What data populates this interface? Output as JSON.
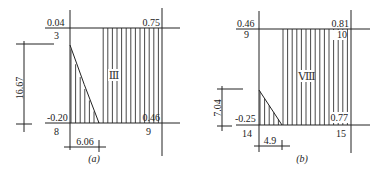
{
  "panels": [
    {
      "id": "a",
      "caption": "(a)",
      "region_label": "Ⅲ",
      "top_left_value": "0.04",
      "top_right_value": "0.75",
      "bottom_left_value": "-0.20",
      "bottom_right_value": "0.46",
      "top_left_node": "3",
      "bottom_left_node": "8",
      "bottom_right_node": "9",
      "vertical_dimension": "16.67",
      "horizontal_dimension": "6.06"
    },
    {
      "id": "b",
      "caption": "(b)",
      "region_label": "Ⅷ",
      "top_left_value": "0.46",
      "top_right_value": "0.81",
      "bottom_left_value": "-0.25",
      "bottom_right_value": "0.77",
      "top_left_node": "9",
      "top_right_node": "10",
      "bottom_left_node": "14",
      "bottom_right_node": "15",
      "vertical_dimension": "7.04",
      "horizontal_dimension": "4.9"
    }
  ]
}
